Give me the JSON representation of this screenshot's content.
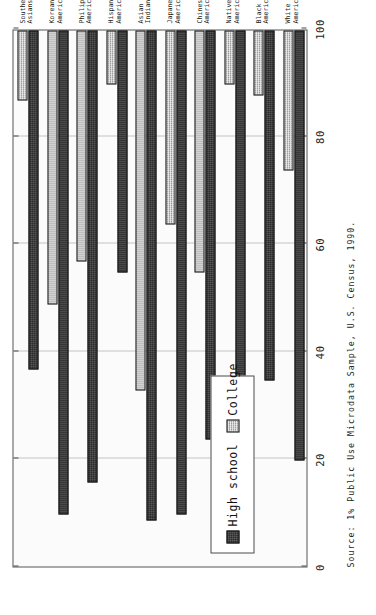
{
  "figure": {
    "source_note": "Source:  1% Public Use Microdata Sample, U.S. Census, 1990.",
    "legend": {
      "items": [
        {
          "label": "High school",
          "swatch": "dark-hatched-swatch",
          "color": "#2b2b2b"
        },
        {
          "label": "College",
          "swatch": "gray-hatched-swatch",
          "color": "#bdbdbd"
        }
      ]
    }
  },
  "chart_data": {
    "type": "bar",
    "orientation": "horizontal",
    "title": "",
    "xlabel": "",
    "ylabel": "",
    "xlim": [
      0,
      100
    ],
    "xticks": [
      0,
      20,
      40,
      60,
      80,
      100
    ],
    "xtick_labels": [
      "0",
      "20",
      "40",
      "60",
      "80",
      "100"
    ],
    "grid": true,
    "legend_position": "inside-lower-left",
    "categories": [
      "White\nAmericans",
      "Black\nAmericans",
      "Native\nAmericans",
      "Chinese\nAmericans",
      "Japanese\nAmericans",
      "Asian\nIndians",
      "Hispanic\nAmericans",
      "Philippine\nAmericans",
      "Korean\nAmericans",
      "Southeast\nAsians"
    ],
    "series": [
      {
        "name": "High school",
        "color": "#2b2b2b",
        "values": [
          80,
          65,
          66,
          76,
          90,
          91,
          45,
          84,
          90,
          63
        ]
      },
      {
        "name": "College",
        "color": "#bdbdbd",
        "values": [
          26,
          12,
          10,
          45,
          36,
          67,
          10,
          43,
          51,
          13
        ]
      }
    ]
  }
}
